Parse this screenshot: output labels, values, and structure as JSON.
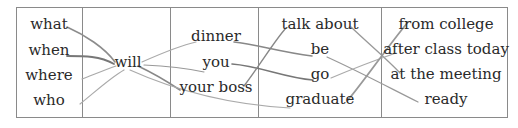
{
  "columns": [
    {
      "id": "wh",
      "words": [
        "what",
        "when",
        "where",
        "who"
      ]
    },
    {
      "id": "aux",
      "words": [
        "will"
      ]
    },
    {
      "id": "subject",
      "words": [
        "dinner",
        "you",
        "your boss"
      ]
    },
    {
      "id": "verb",
      "words": [
        "talk about",
        "be",
        "go",
        "graduate"
      ]
    },
    {
      "id": "phrase",
      "words": [
        "from college",
        "after class today",
        "at the meeting",
        "ready"
      ]
    }
  ],
  "line_color": "#8c8c8c"
}
